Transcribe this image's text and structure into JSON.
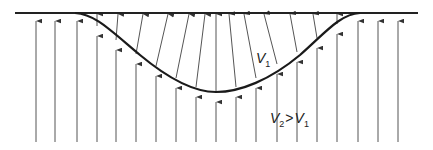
{
  "diagram": {
    "labels": {
      "upper_medium": {
        "symbol": "V",
        "subscript": "1"
      },
      "lower_medium": {
        "lhs_symbol": "V",
        "lhs_subscript": "2",
        "relation": ">",
        "rhs_symbol": "V",
        "rhs_subscript": "1"
      }
    },
    "colors": {
      "line": "#2a2a2a",
      "ray": "#555555",
      "background": "#ffffff"
    },
    "surface_y": 13,
    "bottom_y": 142,
    "rays": [
      {
        "x": 36,
        "curve_y": 14,
        "top_x": 36
      },
      {
        "x": 55,
        "curve_y": 14,
        "top_x": 55
      },
      {
        "x": 77,
        "curve_y": 14,
        "top_x": 77
      },
      {
        "x": 97,
        "curve_y": 26,
        "top_x": 97
      },
      {
        "x": 116,
        "curve_y": 40,
        "top_x": 118
      },
      {
        "x": 136,
        "curve_y": 54,
        "top_x": 143
      },
      {
        "x": 156,
        "curve_y": 66,
        "top_x": 168
      },
      {
        "x": 176,
        "curve_y": 78,
        "top_x": 189
      },
      {
        "x": 196,
        "curve_y": 87,
        "top_x": 205
      },
      {
        "x": 216,
        "curve_y": 92,
        "top_x": 216
      },
      {
        "x": 236,
        "curve_y": 87,
        "top_x": 229
      },
      {
        "x": 256,
        "curve_y": 78,
        "top_x": 244
      },
      {
        "x": 277,
        "curve_y": 64,
        "top_x": 264
      },
      {
        "x": 297,
        "curve_y": 52,
        "top_x": 290
      },
      {
        "x": 317,
        "curve_y": 38,
        "top_x": 313
      },
      {
        "x": 337,
        "curve_y": 24,
        "top_x": 337
      },
      {
        "x": 358,
        "curve_y": 14,
        "top_x": 358
      },
      {
        "x": 378,
        "curve_y": 14,
        "top_x": 378
      },
      {
        "x": 398,
        "curve_y": 14,
        "top_x": 398
      }
    ]
  }
}
